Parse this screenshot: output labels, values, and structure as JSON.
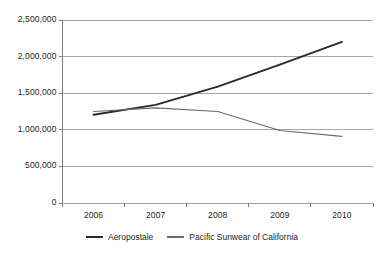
{
  "chart_data": {
    "type": "line",
    "title": "",
    "subtitle": "",
    "xlabel": "",
    "ylabel": "",
    "categories": [
      "2006",
      "2007",
      "2008",
      "2009",
      "2010"
    ],
    "x": [
      2006,
      2007,
      2008,
      2009,
      2010
    ],
    "series": [
      {
        "name": "Aeropostale",
        "color": "#2b2b2b",
        "width": 1.9,
        "values": [
          1205000,
          1340000,
          1590000,
          1890000,
          2200000
        ]
      },
      {
        "name": "Pacific Sunwear of California",
        "color": "#6b6b6b",
        "width": 1.1,
        "values": [
          1250000,
          1300000,
          1250000,
          990000,
          910000
        ]
      }
    ],
    "ylim": [
      0,
      2500000
    ],
    "ytick_values": [
      0,
      500000,
      1000000,
      1500000,
      2000000,
      2500000
    ],
    "ytick_labels": [
      "0",
      "500,000",
      "1,000,000",
      "1,500,000",
      "2,000,000",
      "2,500,000"
    ],
    "grid": true,
    "grid_axis": "y",
    "legend_position": "bottom",
    "legend_entries": [
      "Aeropostale",
      "Pacific Sunwear of California"
    ]
  },
  "axes": {
    "grid_color": "#a6a6a6",
    "axis_color": "#808080",
    "tick_color": "#808080",
    "text_color": "#231f20",
    "background": "#ffffff"
  },
  "caption": {
    "clipped_text": ""
  }
}
